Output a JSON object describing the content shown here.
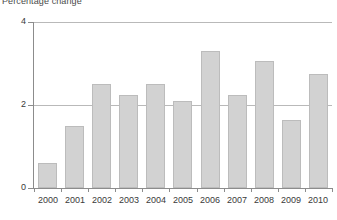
{
  "chart_data": {
    "type": "bar",
    "title": "Percentage change",
    "subtitle": "",
    "xlabel": "",
    "ylabel": "",
    "categories": [
      "2000",
      "2001",
      "2002",
      "2003",
      "2004",
      "2005",
      "2006",
      "2007",
      "2008",
      "2009",
      "2010"
    ],
    "values": [
      0.6,
      1.5,
      2.5,
      2.25,
      2.5,
      2.1,
      3.3,
      2.25,
      3.05,
      1.65,
      2.75
    ],
    "ylim": [
      0,
      4
    ],
    "yticks": [
      0,
      2,
      4
    ],
    "ytick_labels": [
      "0",
      "2",
      "4"
    ],
    "grid": true,
    "gridlines_at": [
      2,
      4
    ],
    "legend": null,
    "legend_position": "none",
    "bar_fill_color": "#d2d2d2",
    "bar_border_color": "#bcbcbc",
    "axis_color": "#8c8c8c",
    "gridline_color": "#b9b9b9",
    "text_color": "#3a3a3a",
    "background_color": "#ffffff"
  }
}
